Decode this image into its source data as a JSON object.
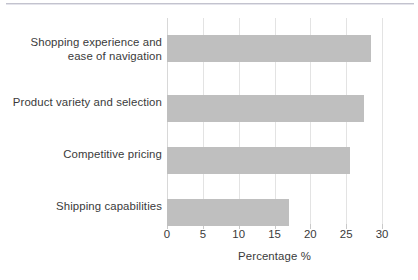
{
  "chart_data": {
    "type": "bar",
    "orientation": "horizontal",
    "title": "",
    "subtitle": "",
    "xlabel": "Percentage %",
    "ylabel": "",
    "categories": [
      "Shopping experience and ease of navigation",
      "Product variety and selection",
      "Competitive pricing",
      "Shipping capabilities"
    ],
    "category_lines": [
      [
        "Shopping experience and",
        "ease of navigation"
      ],
      [
        "Product variety and selection"
      ],
      [
        "Competitive pricing"
      ],
      [
        "Shipping capabilities"
      ]
    ],
    "values": [
      28.5,
      27.5,
      25.5,
      17.0
    ],
    "xlim": [
      0,
      30
    ],
    "xticks": [
      0,
      5,
      10,
      15,
      20,
      25,
      30
    ],
    "xticklabels": [
      "0",
      "5",
      "10",
      "15",
      "20",
      "25",
      "30"
    ],
    "grid": "vertical",
    "legend": "none",
    "bar_color": "#bfbfbf",
    "grid_color": "#e3e3e3",
    "text_color": "#3a3a3a",
    "background_color": "#ffffff"
  }
}
